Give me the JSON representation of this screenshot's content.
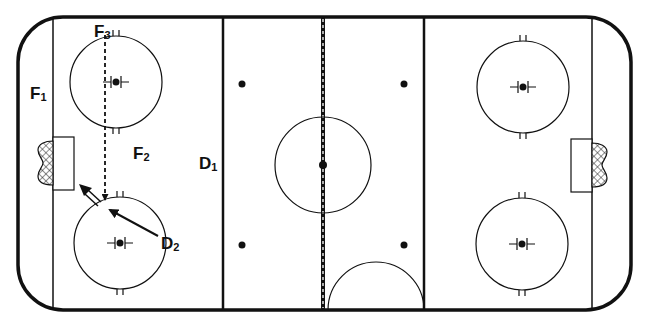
{
  "diagram": {
    "type": "hockey-rink-drill",
    "colors": {
      "line": "#111111",
      "background": "#ffffff",
      "net": "#222222"
    },
    "players": [
      {
        "id": "F1",
        "letter": "F",
        "num": "1",
        "x": 30,
        "y": 85
      },
      {
        "id": "F2",
        "letter": "F",
        "num": "2",
        "x": 133,
        "y": 145
      },
      {
        "id": "F3",
        "letter": "F",
        "num": "3",
        "x": 94,
        "y": 23
      },
      {
        "id": "D1",
        "letter": "D",
        "num": "1",
        "x": 199,
        "y": 155
      },
      {
        "id": "D2",
        "letter": "D",
        "num": "2",
        "x": 162,
        "y": 235
      }
    ],
    "paths": [
      {
        "name": "f3-skate-path",
        "style": "dashed",
        "from": "F3",
        "to": "net-front"
      },
      {
        "name": "d2-pass-arrow",
        "style": "solid",
        "from": "D2",
        "to": "slot"
      },
      {
        "name": "shot-arrow",
        "style": "double",
        "from": "slot",
        "to": "net"
      }
    ]
  }
}
